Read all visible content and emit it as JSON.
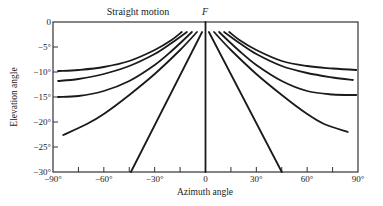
{
  "chart_data": {
    "type": "line",
    "title": "Straight motion",
    "annotation": "F",
    "xlabel": "Azimuth angle",
    "ylabel": "Elevation angle",
    "xlim": [
      -90,
      90
    ],
    "ylim": [
      -30,
      0
    ],
    "x_ticks": [
      -90,
      -60,
      -30,
      0,
      30,
      60,
      90
    ],
    "x_tick_labels": [
      "−90°",
      "−60°",
      "−30°",
      "0",
      "30°",
      "60°",
      "90°"
    ],
    "x_minor_ticks": [
      -75,
      -45,
      -15,
      15,
      45,
      75
    ],
    "y_ticks": [
      0,
      -5,
      -10,
      -15,
      -20,
      -25,
      -30
    ],
    "y_tick_labels": [
      "0",
      "−5°",
      "−10°",
      "−15°",
      "−20°",
      "−25°",
      "−30°"
    ],
    "grid": false,
    "legend": null,
    "series": [
      {
        "name": "left-1",
        "points": [
          [
            -87,
            -9.8
          ],
          [
            -75,
            -9.6
          ],
          [
            -60,
            -9.0
          ],
          [
            -45,
            -7.8
          ],
          [
            -30,
            -5.6
          ],
          [
            -20,
            -3.6
          ],
          [
            -14,
            -2.0
          ]
        ]
      },
      {
        "name": "left-2",
        "points": [
          [
            -87,
            -11.8
          ],
          [
            -75,
            -11.4
          ],
          [
            -60,
            -10.4
          ],
          [
            -45,
            -8.8
          ],
          [
            -30,
            -6.4
          ],
          [
            -20,
            -4.2
          ],
          [
            -11,
            -2.0
          ]
        ]
      },
      {
        "name": "left-3",
        "points": [
          [
            -87,
            -15.0
          ],
          [
            -75,
            -14.8
          ],
          [
            -60,
            -13.8
          ],
          [
            -45,
            -11.8
          ],
          [
            -30,
            -8.6
          ],
          [
            -20,
            -5.8
          ],
          [
            -8,
            -2.0
          ]
        ]
      },
      {
        "name": "left-4",
        "points": [
          [
            -84,
            -22.6
          ],
          [
            -70,
            -20.4
          ],
          [
            -60,
            -18.4
          ],
          [
            -45,
            -14.6
          ],
          [
            -30,
            -10.4
          ],
          [
            -15,
            -5.6
          ],
          [
            -5,
            -2.0
          ]
        ]
      },
      {
        "name": "left-5",
        "points": [
          [
            -44,
            -30.0
          ],
          [
            -2,
            -2.0
          ]
        ]
      },
      {
        "name": "center",
        "points": [
          [
            0,
            0
          ],
          [
            0,
            -30
          ]
        ]
      },
      {
        "name": "right-5",
        "points": [
          [
            2,
            -2.0
          ],
          [
            45,
            -30.0
          ]
        ]
      },
      {
        "name": "right-4",
        "points": [
          [
            5,
            -2.0
          ],
          [
            15,
            -5.6
          ],
          [
            30,
            -10.4
          ],
          [
            45,
            -14.6
          ],
          [
            60,
            -18.4
          ],
          [
            70,
            -20.4
          ],
          [
            84,
            -22.0
          ]
        ]
      },
      {
        "name": "right-3",
        "points": [
          [
            8,
            -2.0
          ],
          [
            20,
            -5.8
          ],
          [
            30,
            -8.6
          ],
          [
            45,
            -11.8
          ],
          [
            60,
            -13.8
          ],
          [
            75,
            -14.5
          ],
          [
            89,
            -14.6
          ]
        ]
      },
      {
        "name": "right-2",
        "points": [
          [
            11,
            -2.0
          ],
          [
            20,
            -4.2
          ],
          [
            30,
            -6.4
          ],
          [
            45,
            -8.8
          ],
          [
            60,
            -10.2
          ],
          [
            75,
            -11.1
          ],
          [
            87,
            -11.6
          ]
        ]
      },
      {
        "name": "right-1",
        "points": [
          [
            14,
            -2.0
          ],
          [
            20,
            -3.6
          ],
          [
            30,
            -5.6
          ],
          [
            45,
            -7.8
          ],
          [
            60,
            -8.8
          ],
          [
            75,
            -9.3
          ],
          [
            89,
            -9.6
          ]
        ]
      }
    ]
  }
}
